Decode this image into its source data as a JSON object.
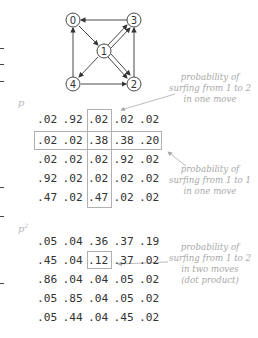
{
  "graph": {
    "nodes": [
      {
        "id": "0",
        "x": 73,
        "y": 20
      },
      {
        "id": "1",
        "x": 104,
        "y": 51
      },
      {
        "id": "2",
        "x": 134,
        "y": 84
      },
      {
        "id": "3",
        "x": 134,
        "y": 20
      },
      {
        "id": "4",
        "x": 73,
        "y": 84
      }
    ],
    "edges": [
      {
        "from": "3",
        "to": "0"
      },
      {
        "from": "0",
        "to": "1"
      },
      {
        "from": "1",
        "to": "3",
        "double": true
      },
      {
        "from": "1",
        "to": "2",
        "double": true
      },
      {
        "from": "1",
        "to": "4"
      },
      {
        "from": "4",
        "to": "0"
      },
      {
        "from": "4",
        "to": "2"
      },
      {
        "from": "2",
        "to": "3"
      }
    ]
  },
  "matrices": {
    "p": {
      "label": "p",
      "rows": [
        [
          ".02",
          ".92",
          ".02",
          ".02",
          ".02"
        ],
        [
          ".02",
          ".02",
          ".38",
          ".38",
          ".20"
        ],
        [
          ".02",
          ".02",
          ".02",
          ".92",
          ".02"
        ],
        [
          ".92",
          ".02",
          ".02",
          ".02",
          ".02"
        ],
        [
          ".47",
          ".02",
          ".47",
          ".02",
          ".02"
        ]
      ]
    },
    "p2": {
      "label": "p",
      "superscript": "2",
      "rows": [
        [
          ".05",
          ".04",
          ".36",
          ".37",
          ".19"
        ],
        [
          ".45",
          ".04",
          ".12",
          ".37",
          ".02"
        ],
        [
          ".86",
          ".04",
          ".04",
          ".05",
          ".02"
        ],
        [
          ".05",
          ".85",
          ".04",
          ".05",
          ".02"
        ],
        [
          ".05",
          ".44",
          ".04",
          ".45",
          ".02"
        ]
      ]
    }
  },
  "annotations": [
    {
      "lines": [
        "probability of",
        "surfing from 1 to 2",
        "in one move"
      ]
    },
    {
      "lines": [
        "probability of",
        "surfing from 1 to 1",
        "in one move"
      ]
    },
    {
      "lines": [
        "probability of",
        "surfing from 1 to 2",
        "in two moves",
        "(dot product)"
      ]
    }
  ],
  "colors": {
    "text": "#333333",
    "annotation": "#a8a8a8",
    "box": "#b0b0b0"
  }
}
